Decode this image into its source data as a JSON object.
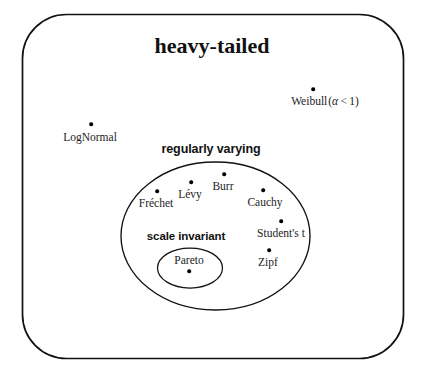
{
  "diagram": {
    "type": "venn-set-diagram",
    "background_color": "#ffffff",
    "stroke_color": "#111111",
    "outer_set": {
      "label": "heavy-tailed",
      "shape": "rounded-rectangle"
    },
    "middle_set": {
      "label": "regularly varying",
      "shape": "ellipse"
    },
    "inner_set": {
      "label": "scale invariant",
      "shape": "ellipse"
    },
    "members": [
      {
        "name": "Weibull",
        "qualifier": "(α < 1)",
        "set": "heavy-tailed",
        "dot_position": "above"
      },
      {
        "name": "LogNormal",
        "qualifier": "",
        "set": "heavy-tailed",
        "dot_position": "above"
      },
      {
        "name": "Fréchet",
        "qualifier": "",
        "set": "regularly varying",
        "dot_position": "above"
      },
      {
        "name": "Lévy",
        "qualifier": "",
        "set": "regularly varying",
        "dot_position": "above"
      },
      {
        "name": "Burr",
        "qualifier": "",
        "set": "regularly varying",
        "dot_position": "above"
      },
      {
        "name": "Cauchy",
        "qualifier": "",
        "set": "regularly varying",
        "dot_position": "above"
      },
      {
        "name": "Student's t",
        "qualifier": "",
        "set": "regularly varying",
        "dot_position": "above"
      },
      {
        "name": "Zipf",
        "qualifier": "",
        "set": "regularly varying",
        "dot_position": "above"
      },
      {
        "name": "Pareto",
        "qualifier": "",
        "set": "scale invariant",
        "dot_position": "below"
      }
    ],
    "weibull_alpha_symbol": "α",
    "weibull_relation": "<",
    "weibull_bound": "1"
  }
}
